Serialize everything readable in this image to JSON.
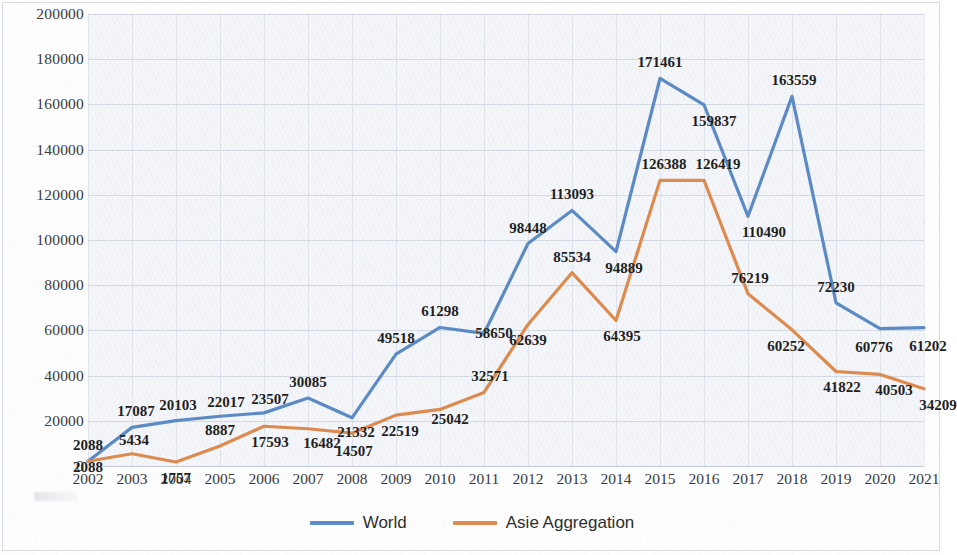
{
  "chart_data": {
    "type": "line",
    "title": "",
    "xlabel": "",
    "ylabel": "",
    "categories": [
      "2002",
      "2003",
      "2004",
      "2005",
      "2006",
      "2007",
      "2008",
      "2009",
      "2010",
      "2011",
      "2012",
      "2013",
      "2014",
      "2015",
      "2016",
      "2017",
      "2018",
      "2019",
      "2020",
      "2021"
    ],
    "ylim": [
      0,
      200000
    ],
    "ytick_labels": [
      "200000",
      "180000",
      "160000",
      "140000",
      "120000",
      "100000",
      "80000",
      "60000",
      "40000",
      "20000",
      "0"
    ],
    "ytick_values": [
      200000,
      180000,
      160000,
      140000,
      120000,
      100000,
      80000,
      60000,
      40000,
      20000,
      0
    ],
    "grid": true,
    "legend_position": "bottom",
    "data_labels": true,
    "series": [
      {
        "name": "World",
        "color": "#5b8ac5",
        "values": [
          2088,
          17087,
          20103,
          22017,
          23507,
          30085,
          21332,
          49518,
          61298,
          58650,
          98448,
          113093,
          94889,
          171461,
          159837,
          110490,
          163559,
          72230,
          60776,
          61202
        ]
      },
      {
        "name": "Asie Aggregation",
        "color": "#dd8a4f",
        "values": [
          2088,
          5434,
          1757,
          8887,
          17593,
          16482,
          14507,
          22519,
          25042,
          32571,
          62639,
          85534,
          64395,
          126388,
          126419,
          76219,
          60252,
          41822,
          40503,
          34209
        ]
      }
    ]
  },
  "legend": {
    "entries": [
      {
        "label": "World",
        "color": "#5b8ac5"
      },
      {
        "label": "Asie Aggregation",
        "color": "#dd8a4f"
      }
    ]
  },
  "colors": {
    "world_line": "#5b8ac5",
    "asia_line": "#dd8a4f",
    "plot_background": "#f4f6f9",
    "page_background": "#fdfdfd",
    "gridline": "#b9c3d2",
    "label_text": "#1f1f1f"
  }
}
